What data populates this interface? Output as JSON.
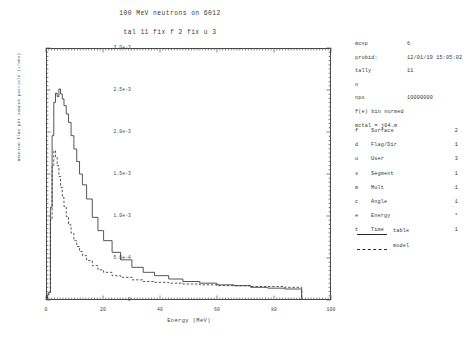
{
  "titles": {
    "main": "100 MeV neutrons on 6012",
    "sub": "tal 11 fix f 2 fix u 3"
  },
  "info": {
    "code_key": "mcnp",
    "code_val": "6",
    "probid_key": "probid:",
    "probid_val": "12/01/19 15:05:02",
    "tally_key": "tally",
    "tally_val": "11",
    "particle": "n",
    "nps_key": "nps",
    "nps_val": "10000000",
    "normed": "f(e) bin normed",
    "mctal": "mctal = j04.m"
  },
  "bin_table": [
    {
      "code": "f",
      "name": "Surface",
      "count": "2"
    },
    {
      "code": "d",
      "name": "Flag/Dir",
      "count": "1"
    },
    {
      "code": "u",
      "name": "User",
      "count": "3"
    },
    {
      "code": "s",
      "name": "Segment",
      "count": "1"
    },
    {
      "code": "m",
      "name": "Mult",
      "count": "1"
    },
    {
      "code": "c",
      "name": "Angle",
      "count": "1"
    },
    {
      "code": "e",
      "name": "Energy",
      "count": "*"
    },
    {
      "code": "t",
      "name": "Time",
      "count": "1"
    }
  ],
  "legend": [
    {
      "style": "solid",
      "label": "table"
    },
    {
      "style": "dashed",
      "label": "model"
    }
  ],
  "chart_data": {
    "type": "line",
    "title": "100 MeV neutrons on 6012",
    "subtitle": "tal 11 fix f 2 fix u 3",
    "xlabel": "Energy (MeV)",
    "ylabel": "Neutron flux per source particle (1/MeV)",
    "xlim": [
      0,
      100
    ],
    "ylim": [
      0,
      0.003
    ],
    "grid": false,
    "legend_position": "right",
    "xticks": [
      0,
      20,
      40,
      60,
      80,
      100
    ],
    "xticklabels": [
      "0",
      "20",
      "40",
      "60",
      "80",
      "100"
    ],
    "yticks": [
      0,
      0.0005,
      0.001,
      0.0015,
      0.002,
      0.0025,
      0.003
    ],
    "yticklabels": [
      "0",
      "5.0e-4",
      "1.0e-3",
      "1.5e-3",
      "2.0e-3",
      "2.5e-3",
      "3.0e-3"
    ],
    "series": [
      {
        "name": "table",
        "style": "solid",
        "x": [
          0.5,
          1.2,
          1.8,
          2.4,
          3.0,
          3.6,
          4.2,
          4.8,
          5.4,
          6.0,
          6.8,
          7.6,
          8.5,
          9.5,
          10.5,
          11.5,
          12.5,
          14.0,
          16.0,
          18.0,
          20.0,
          23.0,
          26.0,
          30.0,
          34.0,
          38.0,
          43.0,
          48.0,
          54.0,
          60.0,
          66.0,
          72.0,
          78.0,
          84.0,
          88.0,
          90.0
        ],
        "y": [
          8e-05,
          0.0011,
          0.00196,
          0.00236,
          0.00247,
          0.00243,
          0.00252,
          0.00246,
          0.0024,
          0.00232,
          0.00222,
          0.00212,
          0.00196,
          0.0018,
          0.00165,
          0.0015,
          0.00137,
          0.0012,
          0.00098,
          0.00082,
          0.0007,
          0.00056,
          0.00047,
          0.00038,
          0.00032,
          0.00028,
          0.00024,
          0.00021,
          0.00019,
          0.00017,
          0.00016,
          0.00014,
          0.00013,
          0.00012,
          0.00012,
          0.00012
        ]
      },
      {
        "name": "model",
        "style": "dashed",
        "x": [
          0.5,
          1.2,
          1.8,
          2.4,
          3.0,
          3.6,
          4.2,
          4.8,
          5.4,
          6.0,
          6.8,
          7.6,
          8.5,
          9.5,
          10.5,
          11.5,
          12.5,
          14.0,
          16.0,
          18.0,
          20.0,
          23.0,
          26.0,
          30.0,
          34.0,
          38.0,
          43.0,
          48.0,
          54.0,
          60.0,
          66.0,
          72.0,
          78.0,
          84.0,
          88.0,
          90.0
        ],
        "y": [
          6e-05,
          0.00095,
          0.0016,
          0.00178,
          0.00171,
          0.0016,
          0.00147,
          0.00134,
          0.00122,
          0.00111,
          0.00099,
          0.00089,
          0.00079,
          0.0007,
          0.00063,
          0.00057,
          0.00052,
          0.00046,
          0.0004,
          0.00035,
          0.00032,
          0.00028,
          0.00026,
          0.00023,
          0.00021,
          0.0002,
          0.00019,
          0.00018,
          0.00017,
          0.00016,
          0.00016,
          0.00015,
          0.00015,
          0.00014,
          0.00014,
          0.00014
        ]
      }
    ]
  }
}
